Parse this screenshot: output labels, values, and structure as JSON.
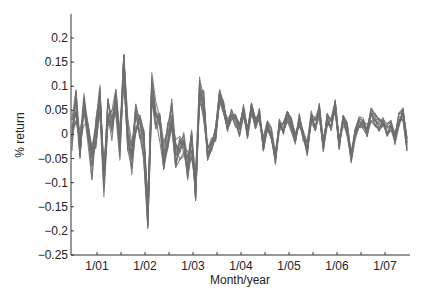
{
  "chart_data": {
    "type": "line",
    "title": "",
    "xlabel": "Month/year",
    "ylabel": "% return",
    "ylim": [
      -0.25,
      0.25
    ],
    "yticks": [
      -0.25,
      -0.2,
      -0.15,
      -0.1,
      -0.05,
      0,
      0.05,
      0.1,
      0.15,
      0.2
    ],
    "ytick_labels": [
      "-0.25",
      "-0.2",
      "-0.15",
      "-0.1",
      "-0.05",
      "0",
      "0.05",
      "0.1",
      "0.15",
      "0.2"
    ],
    "xtick_labels": [
      "1/01",
      "1/02",
      "1/03",
      "1/04",
      "1/05",
      "1/06",
      "1/07"
    ],
    "x_range": [
      "6/00",
      "7/07"
    ],
    "grid": false,
    "legend": null,
    "line_color": "#6e6e6e",
    "series_count": 12,
    "series_description": "Bundle of ~12 overlapping monthly return series (gray), high volatility 2000-2003, calmer 2003-2007",
    "mean_path": [
      0.0,
      0.06,
      -0.02,
      0.05,
      0.0,
      -0.06,
      0.0,
      0.07,
      -0.1,
      0.04,
      0.02,
      0.07,
      -0.02,
      0.15,
      0.0,
      -0.05,
      0.03,
      0.02,
      -0.02,
      -0.16,
      0.1,
      0.04,
      0.02,
      -0.04,
      0.0,
      0.04,
      -0.04,
      -0.03,
      -0.01,
      -0.06,
      -0.02,
      -0.11,
      0.09,
      0.06,
      -0.04,
      -0.02,
      0.0,
      0.08,
      0.06,
      0.02,
      0.04,
      0.03,
      0.01,
      0.05,
      0.0,
      0.05,
      0.02,
      0.04,
      -0.02,
      0.02,
      0.0,
      -0.05,
      0.02,
      0.01,
      0.04,
      0.02,
      -0.01,
      0.03,
      0.0,
      -0.03,
      0.04,
      0.02,
      0.05,
      -0.02,
      0.03,
      0.02,
      0.06,
      -0.02,
      0.03,
      0.01,
      -0.05,
      0.0,
      0.03,
      0.02,
      0.01,
      0.04,
      0.03,
      0.02,
      0.03,
      0.01,
      0.02,
      -0.01,
      0.03,
      0.04,
      -0.02
    ]
  }
}
